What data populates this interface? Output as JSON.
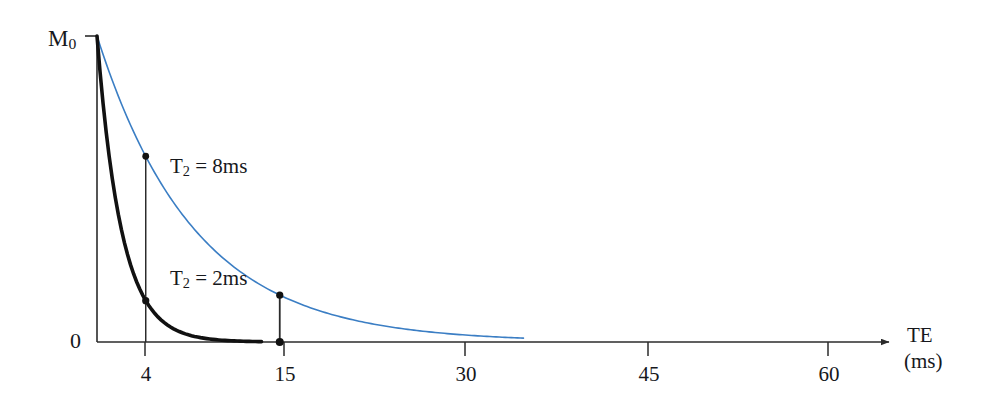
{
  "figure": {
    "type": "line-chart",
    "background_color": "#ffffff",
    "axis_color": "#2b2b2b"
  },
  "axes": {
    "x": {
      "name": "TE",
      "unit_label": "(ms)",
      "tick_labels": [
        "4",
        "15",
        "30",
        "45",
        "60"
      ],
      "tick_values": [
        4,
        15,
        30,
        45,
        60
      ],
      "range": [
        0,
        65
      ],
      "arrow": true
    },
    "y": {
      "top_label": "M",
      "top_label_sub": "0",
      "zero_label": "0",
      "range": [
        0,
        1
      ]
    }
  },
  "curves": [
    {
      "name": "T2 = 2ms",
      "label_prefix": "T",
      "label_sub": "2",
      "label_suffix": " = 2ms",
      "color": "#111111",
      "stroke_width": 3.4,
      "t2_ms": 2,
      "label_position": {
        "x": 170,
        "y": 276
      }
    },
    {
      "name": "T2 = 8ms",
      "label_prefix": "T",
      "label_sub": "2",
      "label_suffix": " = 8ms",
      "color": "#3b7ec4",
      "stroke_width": 1.5,
      "t2_ms": 8,
      "label_position": {
        "x": 170,
        "y": 165
      }
    }
  ],
  "markers": [
    {
      "curve": "T2 = 8ms",
      "te": 4,
      "signal_fraction": 0.607,
      "drop_line": true,
      "dot_color": "#111111"
    },
    {
      "curve": "T2 = 2ms",
      "te": 4,
      "signal_fraction": 0.135,
      "drop_line": true,
      "dot_color": "#111111"
    },
    {
      "curve": "T2 = 8ms",
      "te": 15,
      "signal_fraction": 0.153,
      "drop_line": true,
      "dot_color": "#111111"
    }
  ],
  "chart_data": {
    "type": "line",
    "title": "",
    "xlabel": "TE (ms)",
    "ylabel": "Signal",
    "xlim": [
      0,
      65
    ],
    "ylim": [
      0,
      1
    ],
    "xticks": [
      4,
      15,
      30,
      45,
      60
    ],
    "xticklabels": [
      "4",
      "15",
      "30",
      "45",
      "60"
    ],
    "yticks": [
      0,
      1
    ],
    "yticklabels": [
      "0",
      "M0"
    ],
    "grid": false,
    "legend": "inline-annotations",
    "annotations": [
      "T2 = 2ms",
      "T2 = 8ms"
    ],
    "series": [
      {
        "name": "T2 = 2ms",
        "color": "#111111",
        "formula": "M0 * exp(-TE / 2)",
        "x": [
          0,
          1,
          2,
          3,
          4,
          5,
          6,
          7,
          8,
          9,
          10,
          11,
          12,
          13,
          14,
          15
        ],
        "y": [
          1.0,
          0.607,
          0.368,
          0.223,
          0.135,
          0.082,
          0.05,
          0.03,
          0.018,
          0.011,
          0.0067,
          0.0041,
          0.0025,
          0.0015,
          0.0009,
          0.00055
        ]
      },
      {
        "name": "T2 = 8ms",
        "color": "#3b7ec4",
        "formula": "M0 * exp(-TE / 8)",
        "x": [
          0,
          2,
          4,
          6,
          8,
          10,
          12,
          15,
          18,
          20,
          24,
          28,
          30,
          34,
          38,
          40
        ],
        "y": [
          1.0,
          0.779,
          0.607,
          0.472,
          0.368,
          0.287,
          0.223,
          0.153,
          0.105,
          0.082,
          0.05,
          0.03,
          0.024,
          0.014,
          0.0086,
          0.0067
        ]
      }
    ],
    "marker_points": [
      {
        "series": "T2 = 8ms",
        "x": 4,
        "y": 0.607
      },
      {
        "series": "T2 = 2ms",
        "x": 4,
        "y": 0.135
      },
      {
        "series": "T2 = 8ms",
        "x": 15,
        "y": 0.153
      }
    ]
  }
}
